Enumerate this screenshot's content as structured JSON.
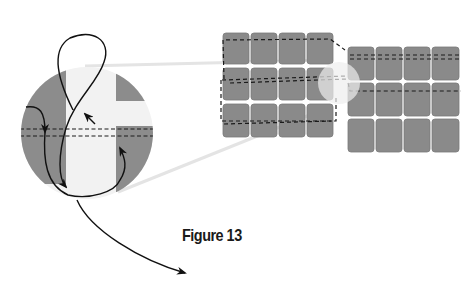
{
  "figure": {
    "caption": "Figure 13"
  },
  "colors": {
    "block_fill": "#8a8a8a",
    "block_stroke": "#7a7a7a",
    "circle_gray": "#8c8c8c",
    "circle_light": "#f2f2f2",
    "zoom_lines": "#e6e6e6",
    "stitch_line": "#1a1a1a",
    "thread": "#111111"
  },
  "elements": {
    "left_panel": {
      "rows": 3,
      "cols": 4
    },
    "right_panel": {
      "rows": 3,
      "cols": 4
    },
    "detail_circle": {
      "label": "magnified stitch detail"
    }
  }
}
